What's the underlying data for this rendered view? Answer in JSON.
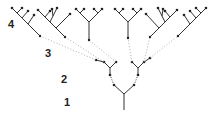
{
  "diagram": {
    "type": "branching-tree",
    "levels": [
      {
        "label": "1",
        "x": 64,
        "y": 97
      },
      {
        "label": "2",
        "x": 61,
        "y": 74
      },
      {
        "label": "3",
        "x": 45,
        "y": 48
      },
      {
        "label": "4",
        "x": 8,
        "y": 19
      }
    ],
    "colors": {
      "line": "#333333",
      "dotted": "#9a9a9a",
      "node": "#222222"
    }
  }
}
